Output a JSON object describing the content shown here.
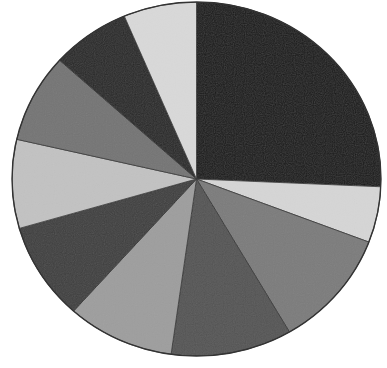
{
  "chart_data": {
    "type": "pie",
    "title": "",
    "legend": [],
    "labels_visible": false,
    "start_angle_deg": 0,
    "direction": "clockwise",
    "slices": [
      {
        "index": 1,
        "value": 25.7,
        "color": "#1c1c1c"
      },
      {
        "index": 2,
        "value": 5.1,
        "color": "#d6d6d6"
      },
      {
        "index": 3,
        "value": 10.8,
        "color": "#7c7c7c"
      },
      {
        "index": 4,
        "value": 10.6,
        "color": "#555555"
      },
      {
        "index": 5,
        "value": 9.4,
        "color": "#9e9e9e"
      },
      {
        "index": 6,
        "value": 8.9,
        "color": "#3f3f3f"
      },
      {
        "index": 7,
        "value": 8.1,
        "color": "#c2c2c2"
      },
      {
        "index": 8,
        "value": 8.1,
        "color": "#757575"
      },
      {
        "index": 9,
        "value": 6.9,
        "color": "#2a2a2a"
      },
      {
        "index": 10,
        "value": 6.4,
        "color": "#d9d9d9"
      }
    ],
    "values": [
      25.7,
      5.1,
      10.8,
      10.6,
      9.4,
      8.9,
      8.1,
      8.1,
      6.9,
      6.4
    ]
  },
  "layout": {
    "cx": 196.5,
    "cy": 179,
    "rx": 184.5,
    "ry": 177,
    "stroke": "#333333"
  }
}
